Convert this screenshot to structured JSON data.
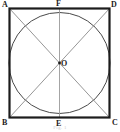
{
  "figure": {
    "caption": "Fig. 1",
    "background_color": "#ffffff",
    "square": {
      "stroke_color": "#1c1c1c",
      "stroke_width": 2.2,
      "left": 9,
      "top": 8,
      "right": 110,
      "bottom": 118
    },
    "circle": {
      "stroke_color": "#4a4a4a",
      "stroke_width": 1.0,
      "center_x": 59.5,
      "center_y": 63,
      "radius": 50.5
    },
    "diagonals": {
      "stroke_color": "#8a8a8a",
      "stroke_width": 0.9
    },
    "vertical_axis": {
      "stroke_color": "#9a9a9a",
      "stroke_width": 0.9
    },
    "center_dot": {
      "fill_color": "#1c1c1c",
      "radius": 1.4
    },
    "labels": {
      "top_left": "A",
      "top_right": "D",
      "bottom_left": "B",
      "bottom_right": "C",
      "top_mid": "F",
      "bottom_mid": "E",
      "center": "O"
    }
  }
}
